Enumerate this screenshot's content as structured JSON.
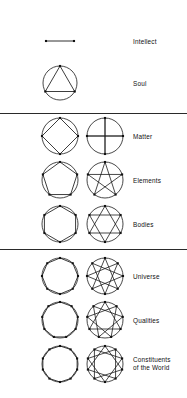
{
  "figure": {
    "title_visible": false,
    "background_color": "#ffffff",
    "stroke_color": "#1a1a1a",
    "vertex_color": "#111111",
    "width": 187,
    "height": 398
  },
  "columns": {
    "polygon_column_x": 60,
    "star_column_x": 105,
    "label_column_x": 133
  },
  "dividers": [
    {
      "name": "divider-after-soul",
      "y": 113
    },
    {
      "name": "divider-after-bodies",
      "y": 249
    },
    {
      "name": "divider-bottom-group",
      "y": 249
    }
  ],
  "rows": [
    {
      "id": "intellect",
      "label": "Intellect",
      "points": 2,
      "shape": "line-segment",
      "has_circle": false,
      "has_star": false,
      "star_step": 0,
      "center_y": 41,
      "radius": 14,
      "label_y": 38
    },
    {
      "id": "soul",
      "label": "Soul",
      "points": 3,
      "shape": "triangle",
      "has_circle": true,
      "has_star": false,
      "star_step": 0,
      "center_y": 83,
      "radius": 17,
      "label_y": 80
    },
    {
      "id": "matter",
      "label": "Matter",
      "points": 4,
      "shape": "square",
      "has_circle": true,
      "has_star": true,
      "star_step": 2,
      "center_y": 136,
      "radius": 18,
      "label_y": 133
    },
    {
      "id": "elements",
      "label": "Elements",
      "points": 5,
      "shape": "pentagon",
      "has_circle": true,
      "has_star": true,
      "star_step": 2,
      "center_y": 180,
      "radius": 18,
      "label_y": 177
    },
    {
      "id": "bodies",
      "label": "Bodies",
      "points": 6,
      "shape": "hexagon",
      "has_circle": true,
      "has_star": true,
      "star_step": 2,
      "center_y": 224,
      "radius": 18,
      "label_y": 221
    },
    {
      "id": "universe",
      "label": "Universe",
      "points": 8,
      "shape": "octagon",
      "has_circle": true,
      "has_star": true,
      "star_step": 3,
      "center_y": 276,
      "radius": 18,
      "label_y": 273
    },
    {
      "id": "qualities",
      "label": "Qualities",
      "points": 9,
      "shape": "nonagon",
      "has_circle": true,
      "has_star": true,
      "star_step": 3,
      "center_y": 320,
      "radius": 18,
      "label_y": 317
    },
    {
      "id": "constituents",
      "label": "Constituents\nof the World",
      "points": 10,
      "shape": "decagon",
      "has_circle": true,
      "has_star": true,
      "star_step": 3,
      "center_y": 364,
      "radius": 18,
      "label_y": 356
    }
  ]
}
